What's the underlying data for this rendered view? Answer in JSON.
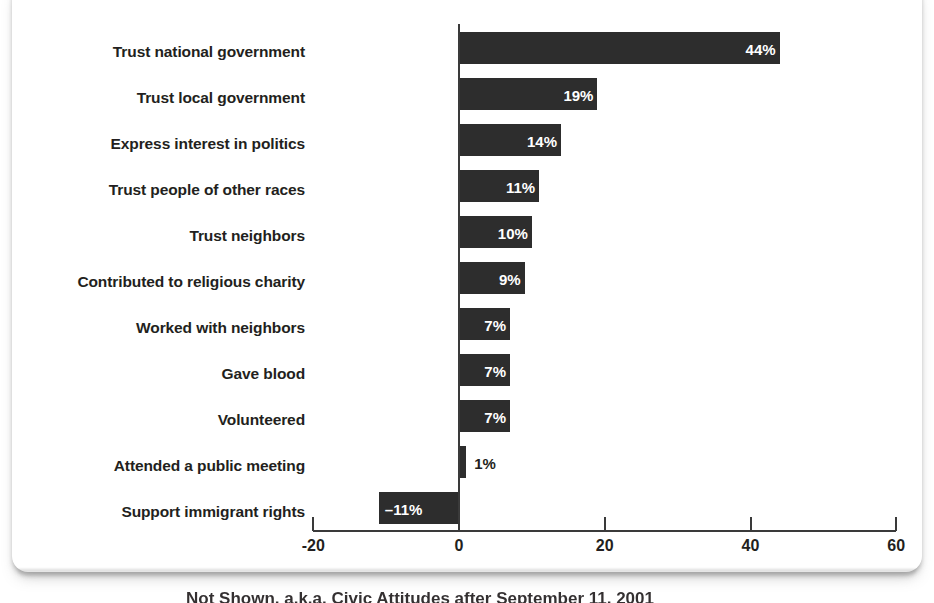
{
  "chart_data": {
    "type": "bar",
    "orientation": "horizontal",
    "title": "",
    "xlabel": "",
    "ylabel": "",
    "xlim": [
      -20,
      60
    ],
    "xticks": [
      -20,
      0,
      20,
      40,
      60
    ],
    "xtick_labels": [
      "-20",
      "0",
      "20",
      "40",
      "60"
    ],
    "grid": false,
    "legend": false,
    "bar_color": "#2d2d2d",
    "value_suffix": "%",
    "categories": [
      "Trust national government",
      "Trust local government",
      "Express interest in politics",
      "Trust people of other races",
      "Trust neighbors",
      "Contributed to religious charity",
      "Worked with neighbors",
      "Gave blood",
      "Volunteered",
      "Attended a public meeting",
      "Support immigrant rights"
    ],
    "values": [
      44,
      19,
      14,
      11,
      10,
      9,
      7,
      7,
      7,
      1,
      -11
    ],
    "value_labels": [
      "44%",
      "19%",
      "14%",
      "11%",
      "10%",
      "9%",
      "7%",
      "7%",
      "7%",
      "1%",
      "–11%"
    ],
    "label_placement": [
      "inside",
      "inside",
      "inside",
      "inside",
      "inside",
      "inside",
      "inside",
      "inside",
      "inside",
      "outside",
      "inside"
    ]
  },
  "caption": {
    "text": "Not Shown, a.k.a. Civic Attitudes after September 11, 2001"
  }
}
